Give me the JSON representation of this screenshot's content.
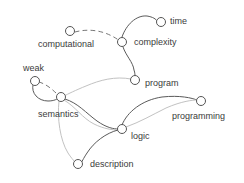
{
  "diagram": {
    "type": "node-link-graph",
    "background_color": "#ffffff",
    "node_fill_color": "#ffffff",
    "node_stroke_color": "#555555",
    "label_color": "#3b3b3b",
    "edge_colors": {
      "dark": "#5a5a5a",
      "light": "#c2c2c2",
      "dashed": "#777777"
    },
    "nodes": [
      {
        "id": "computational",
        "label": "computational",
        "cx": 70,
        "cy": 31,
        "r": 4.5,
        "label_x": 38,
        "label_y": 45,
        "label_anchor": "start"
      },
      {
        "id": "time",
        "label": "time",
        "cx": 161,
        "cy": 22,
        "r": 4.5,
        "label_x": 170,
        "label_y": 22,
        "label_anchor": "start"
      },
      {
        "id": "complexity",
        "label": "complexity",
        "cx": 122,
        "cy": 42,
        "r": 4.5,
        "label_x": 134,
        "label_y": 43,
        "label_anchor": "start"
      },
      {
        "id": "program",
        "label": "program",
        "cx": 135,
        "cy": 80,
        "r": 4.5,
        "label_x": 145,
        "label_y": 84,
        "label_anchor": "start"
      },
      {
        "id": "weak",
        "label": "weak",
        "cx": 35,
        "cy": 81,
        "r": 4.5,
        "label_x": 23,
        "label_y": 69,
        "label_anchor": "start"
      },
      {
        "id": "semantics",
        "label": "semantics",
        "cx": 61,
        "cy": 97,
        "r": 4.5,
        "label_x": 38,
        "label_y": 115,
        "label_anchor": "start"
      },
      {
        "id": "logic",
        "label": "logic",
        "cx": 122,
        "cy": 129,
        "r": 4.5,
        "label_x": 131,
        "label_y": 137,
        "label_anchor": "start"
      },
      {
        "id": "programming",
        "label": "programming",
        "cx": 201,
        "cy": 101,
        "r": 4.5,
        "label_x": 172,
        "label_y": 117,
        "label_anchor": "start"
      },
      {
        "id": "description",
        "label": "description",
        "cx": 78,
        "cy": 164,
        "r": 4.5,
        "label_x": 90,
        "label_y": 165,
        "label_anchor": "start"
      }
    ],
    "edges": [
      {
        "id": "computational-complexity",
        "source": "computational",
        "target": "complexity",
        "style": "dashed",
        "path": "M 75 32 C 90 28 105 31 117 39"
      },
      {
        "id": "complexity-time",
        "source": "complexity",
        "target": "time",
        "style": "dark",
        "path": "M 122 37 C 126 25 136 15 147 16 C 153 17 156 19 157 21"
      },
      {
        "id": "complexity-program",
        "source": "complexity",
        "target": "program",
        "style": "dark",
        "path": "M 123 47 C 126 56 133 62 134 70 C 135 73 135 75 135 76"
      },
      {
        "id": "program-semantics",
        "source": "program",
        "target": "semantics",
        "style": "light",
        "path": "M 131 79 C 115 76 100 80 86 86 C 76 90 68 94 64 96"
      },
      {
        "id": "weak-semantics-solid",
        "source": "weak",
        "target": "semantics",
        "style": "dark",
        "path": "M 33 85 C 31 93 38 101 48 101 C 54 101 58 99 58 98"
      },
      {
        "id": "weak-semantics-dashed",
        "source": "weak",
        "target": "semantics",
        "style": "dashed",
        "path": "M 39 82 C 46 84 52 89 57 94"
      },
      {
        "id": "semantics-logic-dark",
        "source": "semantics",
        "target": "logic",
        "style": "dark",
        "path": "M 65 99 C 78 103 86 113 97 121 C 107 128 114 129 118 129"
      },
      {
        "id": "semantics-logic-light",
        "source": "semantics",
        "target": "logic",
        "style": "light",
        "path": "M 64 100 C 76 107 82 118 94 124 C 104 129 113 130 118 130"
      },
      {
        "id": "semantics-description",
        "source": "semantics",
        "target": "description",
        "style": "light",
        "path": "M 59 101 C 57 118 60 140 68 153 C 72 159 75 162 76 163"
      },
      {
        "id": "logic-description",
        "source": "logic",
        "target": "description",
        "style": "dark",
        "path": "M 118 130 C 106 133 94 142 87 153 C 83 159 82 162 81 163"
      },
      {
        "id": "logic-programming-upper",
        "source": "logic",
        "target": "programming",
        "style": "dark",
        "path": "M 122 125 C 127 112 142 100 162 97 C 180 95 192 98 197 100"
      },
      {
        "id": "logic-programming-lower",
        "source": "logic",
        "target": "programming",
        "style": "light",
        "path": "M 126 127 C 140 122 152 115 166 108 C 182 101 193 100 197 100"
      }
    ]
  }
}
